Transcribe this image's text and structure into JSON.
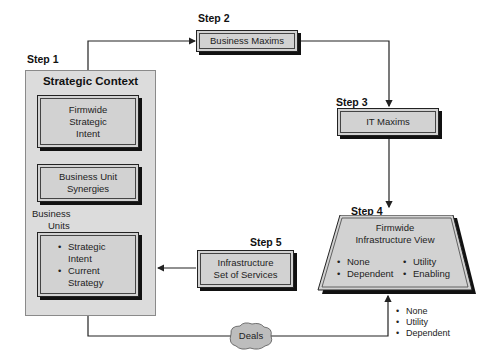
{
  "steps": {
    "step1": "Step 1",
    "step2": "Step 2",
    "step3": "Step 3",
    "step4": "Step 4",
    "step5": "Step 5"
  },
  "strategic_context": {
    "title": "Strategic Context",
    "firmwide_intent": [
      "Firmwide",
      "Strategic",
      "Intent"
    ],
    "synergies": [
      "Business Unit",
      "Synergies"
    ],
    "business_units_label": [
      "Business",
      "Units"
    ],
    "unit_items": [
      "Strategic Intent",
      "Current Strategy"
    ]
  },
  "business_maxims": "Business Maxims",
  "it_maxims": "IT Maxims",
  "infrastructure_view": {
    "title": [
      "Firmwide",
      "Infrastructure View"
    ],
    "items_left": [
      "None",
      "Dependent"
    ],
    "items_right": [
      "Utility",
      "Enabling"
    ]
  },
  "infrastructure_services": [
    "Infrastructure",
    "Set of Services"
  ],
  "deals": "Deals",
  "deal_outputs": [
    "None",
    "Utility",
    "Dependent"
  ],
  "colors": {
    "container_fill": "#dcdcdc",
    "box_fill": "#d2d2d2",
    "shadow": "#111111",
    "line": "#222222"
  }
}
